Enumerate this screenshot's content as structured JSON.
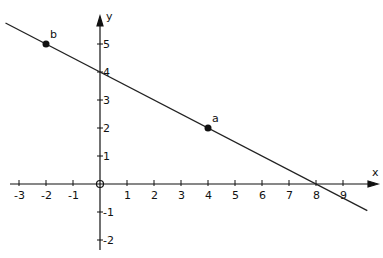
{
  "chart_data": {
    "type": "line",
    "title": "",
    "xlabel": "x",
    "ylabel": "y",
    "xlim": [
      -3.5,
      10
    ],
    "ylim": [
      -2.5,
      6.5
    ],
    "x_ticks": [
      -3,
      -2,
      -1,
      1,
      2,
      3,
      4,
      5,
      6,
      7,
      8,
      9
    ],
    "y_ticks": [
      -2,
      -1,
      1,
      2,
      3,
      4,
      5
    ],
    "origin_label": "0",
    "grid": false,
    "series": [
      {
        "name": "line",
        "x": [
          -3.5,
          9.9
        ],
        "y": [
          5.75,
          -0.95
        ],
        "equation": "y = -0.5x + 4"
      }
    ],
    "points": [
      {
        "label": "b",
        "x": -2,
        "y": 5
      },
      {
        "label": "a",
        "x": 4,
        "y": 2
      }
    ],
    "annotations": [
      {
        "text": "4",
        "x": 0,
        "y": 4,
        "note": "y-intercept"
      }
    ]
  }
}
